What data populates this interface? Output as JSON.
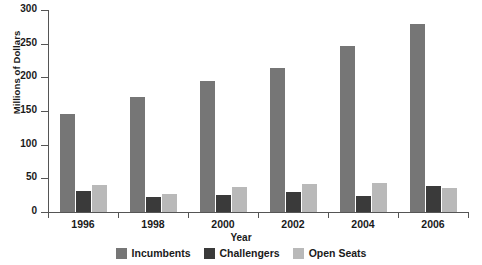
{
  "chart_data": {
    "type": "bar",
    "title": "",
    "xlabel": "Year",
    "ylabel": "Millions of Dollars",
    "categories": [
      "1996",
      "1998",
      "2000",
      "2002",
      "2004",
      "2006"
    ],
    "series": [
      {
        "name": "Incumbents",
        "color": "#767676",
        "values": [
          146,
          171,
          195,
          214,
          247,
          279
        ]
      },
      {
        "name": "Challengers",
        "color": "#3a3a3a",
        "values": [
          31,
          23,
          25,
          29,
          24,
          39
        ]
      },
      {
        "name": "Open Seats",
        "color": "#b9b9b9",
        "values": [
          40,
          27,
          37,
          42,
          43,
          35
        ]
      }
    ],
    "ylim": [
      0,
      300
    ],
    "yticks": [
      0,
      50,
      100,
      150,
      200,
      250,
      300
    ],
    "ytick_labels": [
      "0",
      "50",
      "100",
      "150",
      "200",
      "250",
      "300"
    ],
    "grid": false,
    "legend_position": "bottom"
  }
}
